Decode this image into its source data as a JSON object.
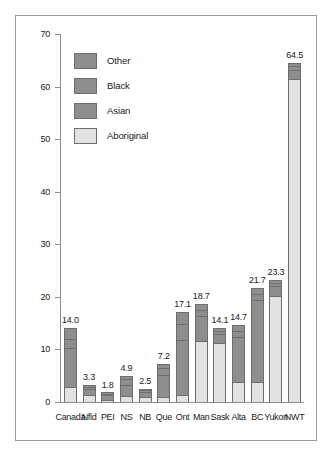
{
  "chart_data": {
    "type": "bar",
    "stacked": true,
    "title": "",
    "subtitle": "",
    "xlabel": "",
    "ylabel": "",
    "ylim": [
      0,
      70
    ],
    "yticks": [
      "0",
      "10",
      "20",
      "30",
      "40",
      "50",
      "60",
      "70"
    ],
    "grid": false,
    "legend_position": "top-left",
    "categories": [
      "Canada",
      "Nfld",
      "PEI",
      "NS",
      "NB",
      "Que",
      "Ont",
      "Man",
      "Sask",
      "Alta",
      "BC",
      "Yukon",
      "NWT"
    ],
    "series": [
      {
        "name": "Aboriginal",
        "color": "#e2e2e2",
        "values": [
          2.8,
          1.3,
          0.4,
          1.2,
          1.0,
          1.0,
          1.3,
          11.6,
          11.2,
          3.8,
          3.9,
          20.2,
          61.5
        ]
      },
      {
        "name": "Asian",
        "color": "#8e8e8e",
        "values": [
          7.5,
          1.2,
          0.9,
          2.0,
          0.9,
          4.2,
          10.5,
          4.8,
          1.8,
          8.6,
          15.6,
          1.9,
          1.7
        ]
      },
      {
        "name": "Black",
        "color": "#8e8e8e",
        "values": [
          1.6,
          0.4,
          0.2,
          1.2,
          0.3,
          1.3,
          3.0,
          1.1,
          0.5,
          1.2,
          1.0,
          0.6,
          0.7
        ]
      },
      {
        "name": "Other",
        "color": "#8e8e8e",
        "values": [
          2.1,
          0.4,
          0.3,
          0.5,
          0.3,
          0.7,
          2.3,
          1.2,
          0.6,
          1.1,
          1.2,
          0.6,
          0.6
        ]
      }
    ],
    "value_labels": [
      "14.0",
      "3.3",
      "1.8",
      "4.9",
      "2.5",
      "7.2",
      "17.1",
      "18.7",
      "14.1",
      "14.7",
      "21.7",
      "23.3",
      "64.5"
    ],
    "totals": [
      14.0,
      3.3,
      1.8,
      4.9,
      2.5,
      7.2,
      17.1,
      18.7,
      14.1,
      14.7,
      21.7,
      23.3,
      64.5
    ]
  },
  "legend": {
    "items": [
      {
        "label": "Other",
        "key": "other"
      },
      {
        "label": "Black",
        "key": "black"
      },
      {
        "label": "Asian",
        "key": "asian"
      },
      {
        "label": "Aboriginal",
        "key": "aboriginal"
      }
    ]
  },
  "colors": {
    "aboriginal": "#e2e2e2",
    "asian": "#8e8e8e",
    "black": "#8e8e8e",
    "other": "#8e8e8e",
    "axis": "#8d8d8d",
    "border": "#9a9a9a",
    "text": "#1a1a1a",
    "background": "#ffffff"
  }
}
